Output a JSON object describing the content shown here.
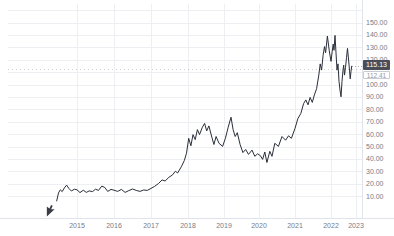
{
  "chart_data": {
    "type": "line",
    "title": "",
    "currency_label": "USD",
    "current_price": "115.13",
    "previous_close": "112.41",
    "current_price_value": 115.13,
    "previous_close_value": 112.41,
    "grid": true,
    "legend": "none",
    "ylim": [
      0,
      160
    ],
    "y_ticks": [
      150,
      140,
      130,
      120,
      100,
      90,
      80,
      70,
      60,
      50,
      40,
      30,
      20,
      10
    ],
    "y_tick_labels": [
      "150.00",
      "140.00",
      "130.00",
      "120.00",
      "100.00",
      "90.00",
      "80.00",
      "70.00",
      "60.00",
      "50.00",
      "40.00",
      "30.00",
      "20.00",
      "10.00"
    ],
    "x_ticks": [
      "2015",
      "2016",
      "2017",
      "2018",
      "2019",
      "2020",
      "2021",
      "2022",
      "2023"
    ],
    "series": [
      {
        "name": "price",
        "color": "#2a2e39",
        "points": [
          [
            2014.45,
            6.5
          ],
          [
            2014.5,
            13
          ],
          [
            2014.55,
            15.5
          ],
          [
            2014.6,
            14
          ],
          [
            2014.66,
            17
          ],
          [
            2014.72,
            19.3
          ],
          [
            2014.78,
            16.5
          ],
          [
            2014.85,
            14.5
          ],
          [
            2014.93,
            16
          ],
          [
            2015.0,
            15.5
          ],
          [
            2015.08,
            13.2
          ],
          [
            2015.17,
            15.2
          ],
          [
            2015.25,
            13.4
          ],
          [
            2015.33,
            14.6
          ],
          [
            2015.42,
            14
          ],
          [
            2015.5,
            16
          ],
          [
            2015.58,
            15
          ],
          [
            2015.67,
            18.5
          ],
          [
            2015.75,
            17.3
          ],
          [
            2015.83,
            14.2
          ],
          [
            2015.92,
            15.8
          ],
          [
            2016.0,
            15.2
          ],
          [
            2016.1,
            14.2
          ],
          [
            2016.2,
            15.8
          ],
          [
            2016.3,
            13.4
          ],
          [
            2016.4,
            14.8
          ],
          [
            2016.5,
            16.1
          ],
          [
            2016.6,
            15
          ],
          [
            2016.7,
            14.2
          ],
          [
            2016.8,
            15.3
          ],
          [
            2016.9,
            15
          ],
          [
            2017.0,
            16.6
          ],
          [
            2017.1,
            18.3
          ],
          [
            2017.2,
            20.5
          ],
          [
            2017.3,
            23.5
          ],
          [
            2017.38,
            22.6
          ],
          [
            2017.48,
            25.5
          ],
          [
            2017.58,
            27.5
          ],
          [
            2017.66,
            30.5
          ],
          [
            2017.72,
            29
          ],
          [
            2017.82,
            34
          ],
          [
            2017.9,
            39
          ],
          [
            2017.96,
            45
          ],
          [
            2018.02,
            57
          ],
          [
            2018.08,
            51
          ],
          [
            2018.14,
            60
          ],
          [
            2018.2,
            56
          ],
          [
            2018.26,
            64
          ],
          [
            2018.32,
            60
          ],
          [
            2018.4,
            66
          ],
          [
            2018.46,
            69
          ],
          [
            2018.52,
            63
          ],
          [
            2018.58,
            67
          ],
          [
            2018.66,
            58
          ],
          [
            2018.72,
            52
          ],
          [
            2018.78,
            58.5
          ],
          [
            2018.86,
            53
          ],
          [
            2018.96,
            50.5
          ],
          [
            2019.04,
            57
          ],
          [
            2019.12,
            66
          ],
          [
            2019.2,
            74
          ],
          [
            2019.26,
            64
          ],
          [
            2019.32,
            58.5
          ],
          [
            2019.38,
            61.5
          ],
          [
            2019.46,
            52
          ],
          [
            2019.54,
            45.5
          ],
          [
            2019.62,
            48
          ],
          [
            2019.7,
            44
          ],
          [
            2019.8,
            47.5
          ],
          [
            2019.88,
            42.5
          ],
          [
            2019.96,
            44.5
          ],
          [
            2020.04,
            43
          ],
          [
            2020.1,
            40
          ],
          [
            2020.16,
            46
          ],
          [
            2020.22,
            37.5
          ],
          [
            2020.3,
            46.5
          ],
          [
            2020.36,
            42.5
          ],
          [
            2020.44,
            53
          ],
          [
            2020.54,
            50.5
          ],
          [
            2020.64,
            58.5
          ],
          [
            2020.74,
            55.5
          ],
          [
            2020.82,
            59
          ],
          [
            2020.9,
            57
          ],
          [
            2021.0,
            65
          ],
          [
            2021.08,
            73
          ],
          [
            2021.16,
            77
          ],
          [
            2021.24,
            85
          ],
          [
            2021.3,
            88
          ],
          [
            2021.36,
            84
          ],
          [
            2021.42,
            90
          ],
          [
            2021.48,
            86
          ],
          [
            2021.54,
            92
          ],
          [
            2021.6,
            97
          ],
          [
            2021.66,
            108
          ],
          [
            2021.7,
            117
          ],
          [
            2021.74,
            112
          ],
          [
            2021.78,
            124
          ],
          [
            2021.82,
            131
          ],
          [
            2021.85,
            126
          ],
          [
            2021.9,
            139.5
          ],
          [
            2021.95,
            128
          ],
          [
            2022.0,
            119
          ],
          [
            2022.05,
            127
          ],
          [
            2022.09,
            133
          ],
          [
            2022.12,
            128
          ],
          [
            2022.16,
            140
          ],
          [
            2022.2,
            126
          ],
          [
            2022.24,
            112
          ],
          [
            2022.28,
            117
          ],
          [
            2022.32,
            103
          ],
          [
            2022.36,
            96
          ],
          [
            2022.4,
            90.5
          ],
          [
            2022.44,
            103
          ],
          [
            2022.48,
            112
          ],
          [
            2022.51,
            116
          ],
          [
            2022.54,
            108
          ],
          [
            2022.58,
            114
          ],
          [
            2022.62,
            122
          ],
          [
            2022.66,
            129.5
          ],
          [
            2022.7,
            121
          ],
          [
            2022.74,
            112
          ],
          [
            2022.77,
            105
          ],
          [
            2022.8,
            111
          ],
          [
            2022.83,
            115.13
          ]
        ]
      }
    ]
  },
  "colors": {
    "line": "#2a2e39",
    "grid": "#edeff2",
    "axis_text": "#787b86",
    "badge_bg": "#4a4d57",
    "badge_text": "#ffffff",
    "background": "#ffffff"
  },
  "icons": {
    "mouse_cursor_icon": "pointer-arrow"
  }
}
